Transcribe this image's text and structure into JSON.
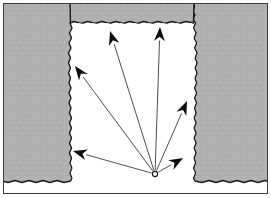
{
  "figure": {
    "width": 271,
    "height": 198,
    "background_color": "#ffffff",
    "caption": "",
    "title": ""
  },
  "frame": {
    "stroke_color": "#3c3c3c",
    "stroke_width": 1,
    "x": 3,
    "y": 3,
    "width": 265,
    "height": 191,
    "fill": "#ffffff"
  },
  "material": {
    "fill_color": "#b2b2b2",
    "edge_color": "#1a1a1a",
    "edge_width": 1.4,
    "texture_color": "#a8a8a8",
    "label": "gray-medium-region"
  },
  "notch": {
    "fill_color": "#ffffff",
    "left_wall_x": 71,
    "right_wall_x": 194,
    "top_y": 23,
    "bottom_open_y": 182,
    "label": "white-notch-cavity"
  },
  "source": {
    "label": "o",
    "x": 155,
    "y": 174,
    "radius": 2.6,
    "stroke_color": "#1a1a1a",
    "fill_color": "#ffffff"
  },
  "rays": {
    "line_color": "#3a3a3a",
    "line_width": 0.9,
    "arrow_fill": "#0d0d0d",
    "count": 6,
    "items": [
      {
        "id": "ray-1",
        "name": "ray-lower-left",
        "tip_x": 73,
        "tip_y": 151,
        "angle_label": ""
      },
      {
        "id": "ray-2",
        "name": "ray-upper-left",
        "tip_x": 75,
        "tip_y": 66,
        "angle_label": ""
      },
      {
        "id": "ray-3",
        "name": "ray-upper-left-mid",
        "tip_x": 110,
        "tip_y": 31,
        "angle_label": ""
      },
      {
        "id": "ray-4",
        "name": "ray-upper-right-mid",
        "tip_x": 160,
        "tip_y": 27,
        "angle_label": ""
      },
      {
        "id": "ray-5",
        "name": "ray-upper-right",
        "tip_x": 187,
        "tip_y": 101,
        "angle_label": ""
      },
      {
        "id": "ray-6",
        "name": "ray-lower-right",
        "tip_x": 183,
        "tip_y": 158,
        "angle_label": ""
      }
    ]
  }
}
